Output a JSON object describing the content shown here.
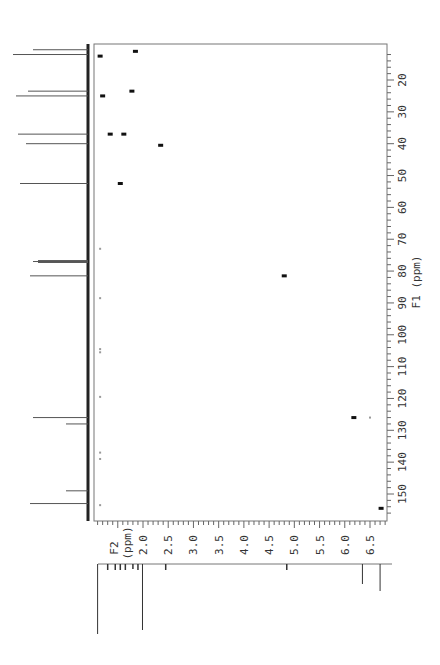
{
  "chart_data": {
    "type": "scatter",
    "title": "",
    "subtitle": "2D HSQC-type NMR correlation spectrum (rotated view)",
    "xlabel": "F2 (ppm)",
    "ylabel": "F1 (ppm)",
    "f1_axis": {
      "label": "F1 (ppm)",
      "range": [
        9,
        158
      ],
      "ticks": [
        20,
        30,
        40,
        50,
        60,
        70,
        80,
        90,
        100,
        110,
        120,
        130,
        140,
        150
      ],
      "tick_labels": [
        "20",
        "30",
        "40",
        "50",
        "60",
        "70",
        "80",
        "90",
        "100",
        "110",
        "120",
        "130",
        "140",
        "150"
      ]
    },
    "f2_axis": {
      "label": "F2 (ppm)",
      "label_line1": "F2",
      "label_line2": "(ppm)",
      "range": [
        1.03,
        6.85
      ],
      "ticks": [
        2.0,
        2.5,
        3.0,
        3.5,
        4.0,
        4.5,
        5.0,
        5.5,
        6.0,
        6.5
      ],
      "tick_labels": [
        "2.0",
        "2.5",
        "3.0",
        "3.5",
        "4.0",
        "4.5",
        "5.0",
        "5.5",
        "6.0",
        "6.5"
      ]
    },
    "cross_peaks": [
      {
        "f2": 1.15,
        "f1": 12.5
      },
      {
        "f2": 1.85,
        "f1": 11.0
      },
      {
        "f2": 1.2,
        "f1": 25.0
      },
      {
        "f2": 1.78,
        "f1": 23.5
      },
      {
        "f2": 1.35,
        "f1": 37.0
      },
      {
        "f2": 1.62,
        "f1": 37.0
      },
      {
        "f2": 2.35,
        "f1": 40.5
      },
      {
        "f2": 1.55,
        "f1": 52.5
      },
      {
        "f2": 4.8,
        "f1": 81.5
      },
      {
        "f2": 6.18,
        "f1": 126.0
      },
      {
        "f2": 6.72,
        "f1": 154.5
      }
    ],
    "weak_peaks": [
      {
        "f2": 1.15,
        "f1": 73.0
      },
      {
        "f2": 1.15,
        "f1": 88.5
      },
      {
        "f2": 1.15,
        "f1": 104.5
      },
      {
        "f2": 1.15,
        "f1": 105.5
      },
      {
        "f2": 1.15,
        "f1": 119.5
      },
      {
        "f2": 1.15,
        "f1": 137.0
      },
      {
        "f2": 1.15,
        "f1": 139.0
      },
      {
        "f2": 6.5,
        "f1": 126.0
      },
      {
        "f2": 1.15,
        "f1": 153.5
      }
    ],
    "f1_projection_peaks": [
      {
        "ppm": 10.5,
        "height": 55
      },
      {
        "ppm": 12.0,
        "height": 75
      },
      {
        "ppm": 23.5,
        "height": 60
      },
      {
        "ppm": 25.0,
        "height": 72
      },
      {
        "ppm": 37.0,
        "height": 70
      },
      {
        "ppm": 40.0,
        "height": 62
      },
      {
        "ppm": 52.5,
        "height": 68
      },
      {
        "ppm": 76.7,
        "height": 50
      },
      {
        "ppm": 77.0,
        "height": 55
      },
      {
        "ppm": 77.3,
        "height": 50
      },
      {
        "ppm": 81.5,
        "height": 58
      },
      {
        "ppm": 126.0,
        "height": 55
      },
      {
        "ppm": 128.0,
        "height": 22
      },
      {
        "ppm": 149.0,
        "height": 22
      },
      {
        "ppm": 153.0,
        "height": 58
      }
    ],
    "f2_projection_peaks": [
      {
        "ppm": 1.1,
        "height": 70
      },
      {
        "ppm": 1.3,
        "height": 6
      },
      {
        "ppm": 1.45,
        "height": 6
      },
      {
        "ppm": 1.55,
        "height": 6
      },
      {
        "ppm": 1.65,
        "height": 6
      },
      {
        "ppm": 1.8,
        "height": 5
      },
      {
        "ppm": 1.9,
        "height": 6
      },
      {
        "ppm": 1.99,
        "height": 66
      },
      {
        "ppm": 2.45,
        "height": 6
      },
      {
        "ppm": 4.85,
        "height": 6
      },
      {
        "ppm": 6.35,
        "height": 20
      },
      {
        "ppm": 6.7,
        "height": 27
      }
    ],
    "grid": false,
    "legend": null
  }
}
